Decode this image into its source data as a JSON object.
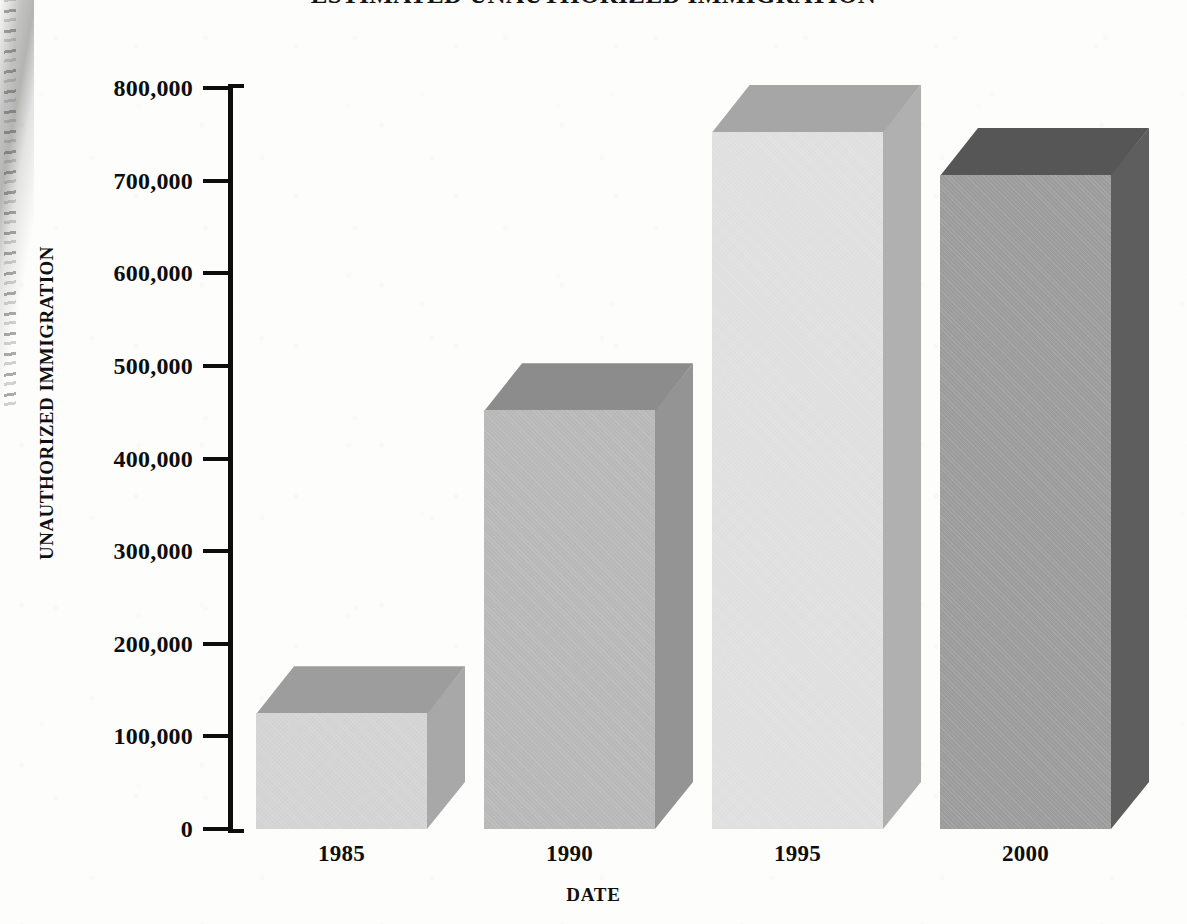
{
  "chart_data": {
    "type": "bar",
    "title": "ESTIMATED UNAUTHORIZED IMMIGRATION",
    "xlabel": "DATE",
    "ylabel": "UNAUTHORIZED IMMIGRATION",
    "categories": [
      "1985",
      "1990",
      "1995",
      "2000"
    ],
    "values": [
      125000,
      452000,
      753000,
      706000
    ],
    "ylim": [
      0,
      800000
    ],
    "ytick_labels": [
      "800,000",
      "700,000",
      "600,000",
      "500,000",
      "400,000",
      "300,000",
      "200,000",
      "100,000",
      "0"
    ],
    "ytick_values": [
      800000,
      700000,
      600000,
      500000,
      400000,
      300000,
      200000,
      100000,
      0
    ],
    "grid": false,
    "legend": false,
    "style": "3d-block-bars",
    "bar_colors": [
      {
        "category": "1985",
        "front": "#d4d4d4",
        "top": "#9d9d9d",
        "side": "#a8a8a8"
      },
      {
        "category": "1990",
        "front": "#b9b9b9",
        "top": "#8c8c8c",
        "side": "#949494"
      },
      {
        "category": "1995",
        "front": "#e0e0e0",
        "top": "#a6a6a6",
        "side": "#b0b0b0"
      },
      {
        "category": "2000",
        "front": "#9d9d9d",
        "top": "#565656",
        "side": "#5e5e5e"
      }
    ]
  },
  "page": {
    "background": "#fdfdfc",
    "ink": "#0d0d0d"
  }
}
